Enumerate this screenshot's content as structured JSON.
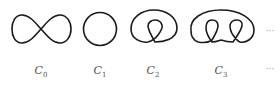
{
  "figure": {
    "curves": [
      {
        "id": "C0",
        "shape": "figure-eight",
        "label_base": "C",
        "label_sub": "0"
      },
      {
        "id": "C1",
        "shape": "circle",
        "label_base": "C",
        "label_sub": "1"
      },
      {
        "id": "C2",
        "shape": "loop-with-one-inner-curl",
        "label_base": "C",
        "label_sub": "2"
      },
      {
        "id": "C3",
        "shape": "loop-with-two-inner-curls",
        "label_base": "C",
        "label_sub": "3"
      }
    ],
    "continuation_top": "···",
    "continuation_bottom": "···",
    "stroke_color": "#1a1a1a",
    "label_color": "#555555"
  }
}
